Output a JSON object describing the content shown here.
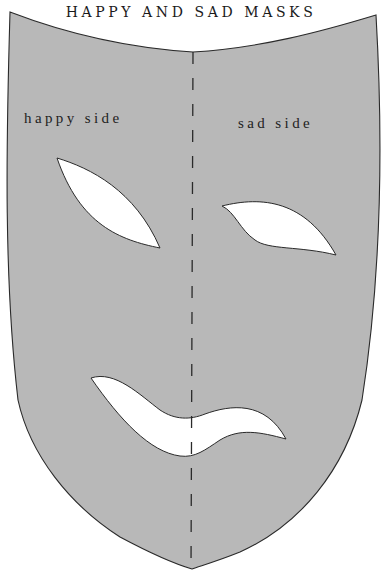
{
  "diagram": {
    "title": "HAPPY AND SAD MASKS",
    "labels": {
      "happy_side": "happy side",
      "sad_side": "sad side"
    },
    "colors": {
      "mask_fill": "#b8b8b8",
      "cutout_fill": "#ffffff",
      "outline": "#2a2a2a",
      "fold_line": "#2a2a2a",
      "background": "#ffffff"
    },
    "elements": {
      "mask": "mask-outline",
      "fold_line": "dashed-center-fold-line",
      "left_eye": "happy-eye-cutout",
      "right_eye": "sad-eye-cutout",
      "mouth": "half-smile-half-frown-mouth-cutout"
    }
  }
}
